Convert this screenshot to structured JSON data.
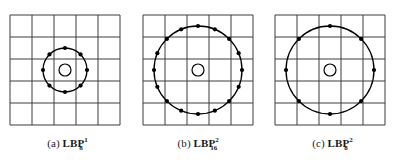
{
  "figure": {
    "title": "",
    "background_color": "#ffffff",
    "line_color": "#3c3c3c",
    "circle_color": "#000000",
    "point_color": "#000000"
  },
  "panels": [
    {
      "id": "panel-a",
      "caption_prefix": "(a)",
      "caption_symbol": "LBP",
      "superscript": "1",
      "subscript": "8",
      "radius_label": "1",
      "points_count": 8,
      "grid_rows": 5,
      "grid_cols": 5,
      "cell_size": 22,
      "sample_radius": 22,
      "center_marker_radius": 6,
      "start_angle_deg": -90,
      "point_dot_radius": 2.1
    },
    {
      "id": "panel-b",
      "caption_prefix": "(b)",
      "caption_symbol": "LBP",
      "superscript": "2",
      "subscript": "16",
      "radius_label": "2",
      "points_count": 16,
      "grid_rows": 5,
      "grid_cols": 5,
      "cell_size": 22,
      "sample_radius": 44,
      "center_marker_radius": 6,
      "start_angle_deg": -90,
      "point_dot_radius": 2.1
    },
    {
      "id": "panel-c",
      "caption_prefix": "(c)",
      "caption_symbol": "LBP",
      "superscript": "2",
      "subscript": "8",
      "radius_label": "2",
      "points_count": 8,
      "grid_rows": 5,
      "grid_cols": 5,
      "cell_size": 22,
      "sample_radius": 44,
      "center_marker_radius": 6,
      "start_angle_deg": -90,
      "point_dot_radius": 2.1
    }
  ],
  "chart_data": {
    "type": "diagram",
    "series": [
      {
        "name": "(a) LBP 8,1",
        "P": 8,
        "R": 1,
        "grid": "5x5"
      },
      {
        "name": "(b) LBP 16,2",
        "P": 16,
        "R": 2,
        "grid": "5x5"
      },
      {
        "name": "(c) LBP 8,2",
        "P": 8,
        "R": 2,
        "grid": "5x5"
      }
    ]
  }
}
